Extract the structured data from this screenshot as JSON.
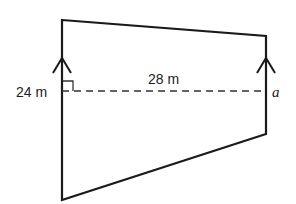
{
  "diagram": {
    "type": "trapezium",
    "labels": {
      "left_side": "24 m",
      "height": "28 m",
      "right_side": "a"
    },
    "vertices": {
      "top_left": [
        62,
        20
      ],
      "top_right": [
        266,
        36
      ],
      "bottom_right": [
        266,
        134
      ],
      "bottom_left": [
        62,
        200
      ]
    },
    "colors": {
      "stroke": "#1a1a1a",
      "background": "#ffffff"
    }
  }
}
